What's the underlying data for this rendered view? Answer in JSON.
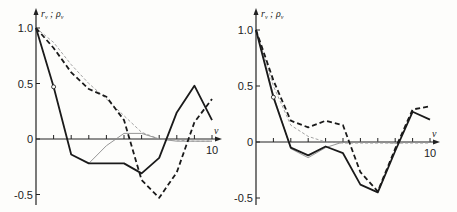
{
  "chart_data": [
    {
      "type": "line",
      "panel": "left",
      "ylabel": "r_ν ; ρ_ν",
      "xlabel": "ν",
      "x": [
        0,
        1,
        2,
        3,
        4,
        5,
        6,
        7,
        8,
        9,
        10
      ],
      "xlim": [
        0,
        10
      ],
      "ylim": [
        -0.55,
        1.05
      ],
      "yticks": [
        "1.0",
        "0.5",
        "0",
        "-0.5"
      ],
      "xticks": [
        "10"
      ],
      "grid": false,
      "series": [
        {
          "name": "solid-thick",
          "style": "solid",
          "weight": "thick",
          "color": "#1a1a1a",
          "values": [
            1.0,
            0.47,
            -0.14,
            -0.22,
            -0.22,
            -0.22,
            -0.31,
            -0.17,
            0.24,
            0.48,
            0.17
          ]
        },
        {
          "name": "dashed-thick",
          "style": "dashed",
          "weight": "thick",
          "color": "#1a1a1a",
          "values": [
            1.0,
            0.82,
            0.6,
            0.45,
            0.38,
            0.17,
            -0.37,
            -0.53,
            -0.3,
            0.15,
            0.36
          ]
        },
        {
          "name": "solid-thin",
          "style": "solid",
          "weight": "thin",
          "color": "#8a8a8a",
          "x_start": 3,
          "values": [
            null,
            null,
            null,
            -0.22,
            -0.06,
            0.05,
            0.05,
            0.0,
            -0.02,
            -0.02,
            -0.02
          ]
        },
        {
          "name": "dashed-thin",
          "style": "dashed",
          "weight": "thin",
          "color": "#9a9a9a",
          "values": [
            1.0,
            0.87,
            0.67,
            0.5,
            0.36,
            0.21,
            0.06,
            0.0,
            -0.01,
            -0.02,
            -0.02
          ]
        }
      ],
      "annotations": [
        {
          "type": "circle-marker",
          "x": 1,
          "y": 0.47
        }
      ]
    },
    {
      "type": "line",
      "panel": "right",
      "ylabel": "r_ν ; ρ_ν",
      "xlabel": "ν",
      "x": [
        0,
        1,
        2,
        3,
        4,
        5,
        6,
        7,
        8,
        9,
        10
      ],
      "xlim": [
        0,
        10
      ],
      "ylim": [
        -0.55,
        1.05
      ],
      "yticks": [
        "1.0",
        "0.5",
        "0",
        "-0.5"
      ],
      "xticks": [
        "10"
      ],
      "grid": false,
      "series": [
        {
          "name": "solid-thick",
          "style": "solid",
          "weight": "thick",
          "color": "#1a1a1a",
          "values": [
            1.0,
            0.4,
            -0.05,
            -0.12,
            -0.04,
            -0.1,
            -0.38,
            -0.45,
            -0.08,
            0.27,
            0.2
          ]
        },
        {
          "name": "dashed-thick",
          "style": "dashed",
          "weight": "thick",
          "color": "#1a1a1a",
          "values": [
            1.0,
            0.55,
            0.19,
            0.13,
            0.19,
            0.15,
            -0.27,
            -0.44,
            -0.06,
            0.29,
            0.32
          ]
        },
        {
          "name": "solid-thin",
          "style": "solid",
          "weight": "thin",
          "color": "#8a8a8a",
          "values": [
            1.0,
            0.42,
            -0.06,
            -0.14,
            -0.05,
            0.0,
            0.0,
            0.0,
            -0.01,
            0.0,
            0.0
          ]
        },
        {
          "name": "dashed-thin",
          "style": "dashed",
          "weight": "thin",
          "color": "#9a9a9a",
          "values": [
            1.0,
            0.5,
            0.15,
            0.05,
            0.0,
            -0.01,
            -0.01,
            -0.01,
            -0.01,
            -0.01,
            -0.01
          ]
        }
      ],
      "annotations": [
        {
          "type": "circle-marker",
          "x": 1,
          "y": 0.4
        }
      ]
    }
  ],
  "panels": [
    {
      "id": "left",
      "origin_x": 36,
      "zero_y": 139,
      "px_per_x": 17.6,
      "px_per_y": 111,
      "y_top": 8,
      "y_bottom": 205,
      "x_right": 222
    },
    {
      "id": "right",
      "origin_x": 256,
      "zero_y": 142,
      "px_per_x": 17.4,
      "px_per_y": 112,
      "y_top": 8,
      "y_bottom": 205,
      "x_right": 440
    }
  ],
  "labels": {
    "ylabel_r": "r",
    "ylabel_sep": ";",
    "ylabel_rho": "ρ",
    "sub": "ν",
    "xlabel": "ν",
    "tick_1": "1.0",
    "tick_05": "0.5",
    "tick_0": "0",
    "tick_m05": "-0.5",
    "tick_10": "10"
  }
}
